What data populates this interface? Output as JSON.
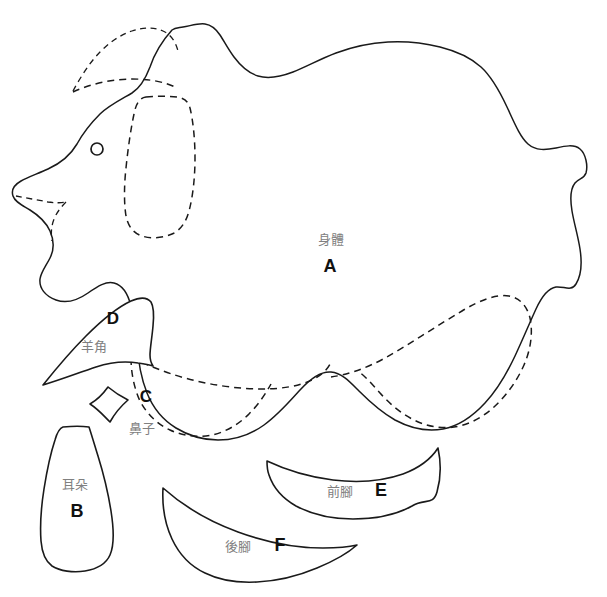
{
  "document": {
    "title": "Stuffed Animal Sewing Pattern Sheet",
    "background_color": "#ffffff",
    "line_color": "#1a1a1a",
    "label_color": "#808080",
    "letter_color": "#111111",
    "width": 607,
    "height": 597
  },
  "pieces": [
    {
      "id": "A",
      "letter": "A",
      "name_cn": "身體",
      "letter_x": 330,
      "letter_y": 272,
      "label_x": 331,
      "label_y": 244
    },
    {
      "id": "B",
      "letter": "B",
      "name_cn": "耳朵",
      "letter_x": 77,
      "letter_y": 517,
      "label_x": 75,
      "label_y": 489
    },
    {
      "id": "C",
      "letter": "C",
      "name_cn": "鼻子",
      "letter_x": 146,
      "letter_y": 402,
      "label_x": 142,
      "label_y": 433
    },
    {
      "id": "D",
      "letter": "D",
      "name_cn": "羊角",
      "letter_x": 113,
      "letter_y": 324,
      "label_x": 94,
      "label_y": 351
    },
    {
      "id": "E",
      "letter": "E",
      "name_cn": "前腳",
      "letter_x": 381,
      "letter_y": 496,
      "label_x": 340,
      "label_y": 496
    },
    {
      "id": "F",
      "letter": "F",
      "name_cn": "後腳",
      "letter_x": 280,
      "letter_y": 551,
      "label_x": 238,
      "label_y": 551
    }
  ],
  "marks": {
    "eye": {
      "cx": 97,
      "cy": 149,
      "r": 6,
      "name": "eye-placement-circle"
    }
  }
}
